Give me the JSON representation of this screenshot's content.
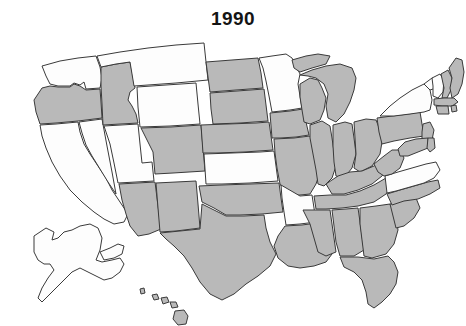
{
  "figure": {
    "title": "1990",
    "type": "choropleth-map",
    "region": "United States",
    "background_color": "#ffffff",
    "border_color": "#3a3a3a"
  },
  "legend": {
    "shaded_color": "#b9b9b9",
    "unshaded_color": "#fdfdfd"
  },
  "chart_data": {
    "type": "map",
    "title": "1990",
    "xlabel": "",
    "ylabel": "",
    "map_region": "united-states",
    "categories": [
      "shaded",
      "unshaded"
    ],
    "colors": {
      "shaded": "#b9b9b9",
      "unshaded": "#fdfdfd"
    },
    "legend_position": "none",
    "grid": false,
    "values": {
      "AL": "shaded",
      "AK": "unshaded",
      "AZ": "shaded",
      "AR": "unshaded",
      "CA": "unshaded",
      "CO": "shaded",
      "CT": "shaded",
      "DE": "shaded",
      "FL": "shaded",
      "GA": "shaded",
      "HI": "shaded",
      "ID": "shaded",
      "IL": "shaded",
      "IN": "shaded",
      "IA": "shaded",
      "KS": "unshaded",
      "KY": "shaded",
      "LA": "shaded",
      "ME": "shaded",
      "MD": "shaded",
      "MA": "shaded",
      "MI": "shaded",
      "MN": "unshaded",
      "MS": "shaded",
      "MO": "shaded",
      "MT": "unshaded",
      "NE": "shaded",
      "NV": "unshaded",
      "NH": "shaded",
      "NJ": "shaded",
      "NM": "shaded",
      "NY": "unshaded",
      "NC": "shaded",
      "ND": "shaded",
      "OH": "shaded",
      "OK": "shaded",
      "OR": "shaded",
      "PA": "shaded",
      "RI": "shaded",
      "SC": "shaded",
      "SD": "shaded",
      "TN": "shaded",
      "TX": "shaded",
      "UT": "unshaded",
      "VT": "unshaded",
      "VA": "unshaded",
      "WA": "unshaded",
      "WV": "shaded",
      "WI": "shaded",
      "WY": "unshaded"
    },
    "state_names": {
      "AL": "Alabama",
      "AK": "Alaska",
      "AZ": "Arizona",
      "AR": "Arkansas",
      "CA": "California",
      "CO": "Colorado",
      "CT": "Connecticut",
      "DE": "Delaware",
      "FL": "Florida",
      "GA": "Georgia",
      "HI": "Hawaii",
      "ID": "Idaho",
      "IL": "Illinois",
      "IN": "Indiana",
      "IA": "Iowa",
      "KS": "Kansas",
      "KY": "Kentucky",
      "LA": "Louisiana",
      "ME": "Maine",
      "MD": "Maryland",
      "MA": "Massachusetts",
      "MI": "Michigan",
      "MN": "Minnesota",
      "MS": "Mississippi",
      "MO": "Missouri",
      "MT": "Montana",
      "NE": "Nebraska",
      "NV": "Nevada",
      "NH": "New Hampshire",
      "NJ": "New Jersey",
      "NM": "New Mexico",
      "NY": "New York",
      "NC": "North Carolina",
      "ND": "North Dakota",
      "OH": "Ohio",
      "OK": "Oklahoma",
      "OR": "Oregon",
      "PA": "Pennsylvania",
      "RI": "Rhode Island",
      "SC": "South Carolina",
      "SD": "South Dakota",
      "TN": "Tennessee",
      "TX": "Texas",
      "UT": "Utah",
      "VT": "Vermont",
      "VA": "Virginia",
      "WA": "Washington",
      "WV": "West Virginia",
      "WI": "Wisconsin",
      "WY": "Wyoming"
    },
    "shaded_count": 36,
    "unshaded_count": 14
  }
}
